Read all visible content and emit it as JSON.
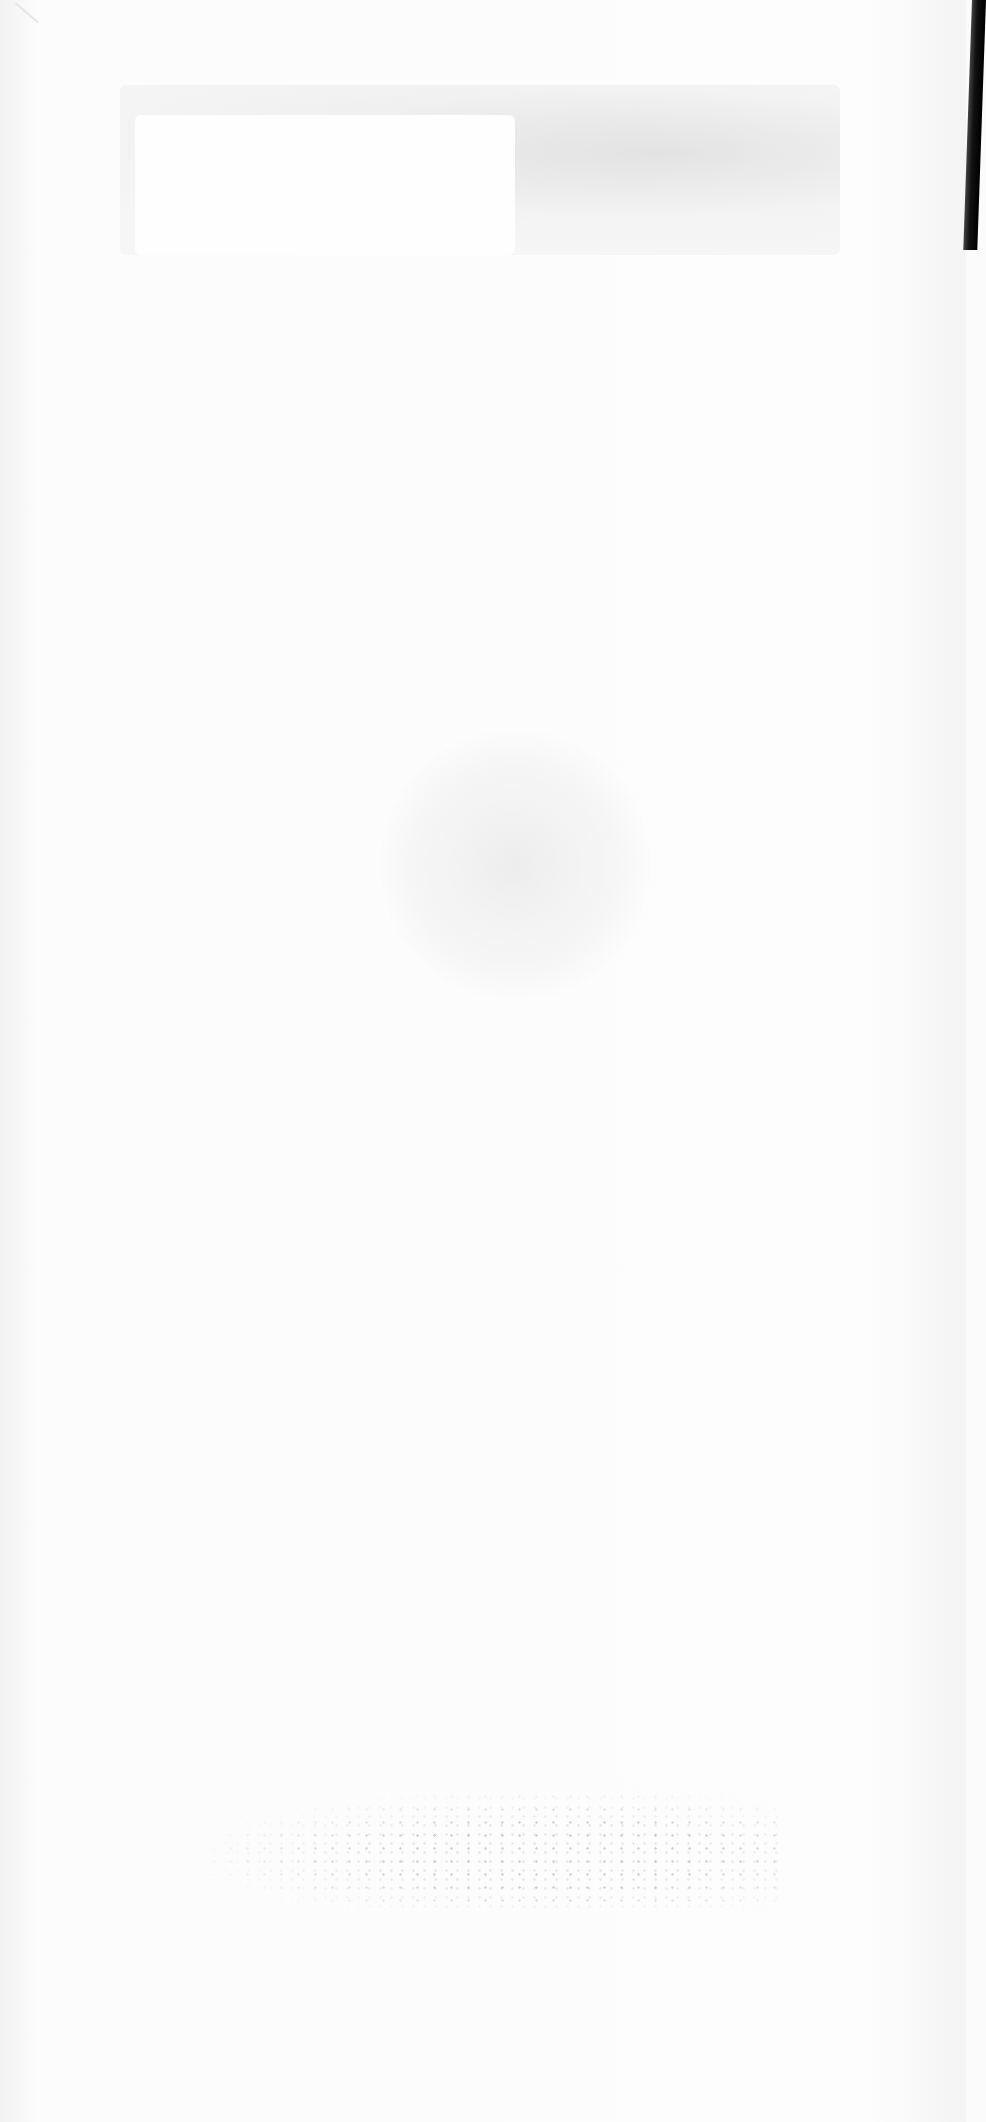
{
  "document": {
    "type": "scanned-blank-page",
    "visible_text": [],
    "note_bleed_through": "Mirrored, illegible show-through from reverse side of the page"
  },
  "bleed_through": {
    "title_lines": [
      "",
      "",
      ""
    ],
    "footer": ""
  },
  "colors": {
    "paper": "#fbfbfb",
    "binding_edge": "#000000",
    "bleed_gray": "#cccccc"
  }
}
